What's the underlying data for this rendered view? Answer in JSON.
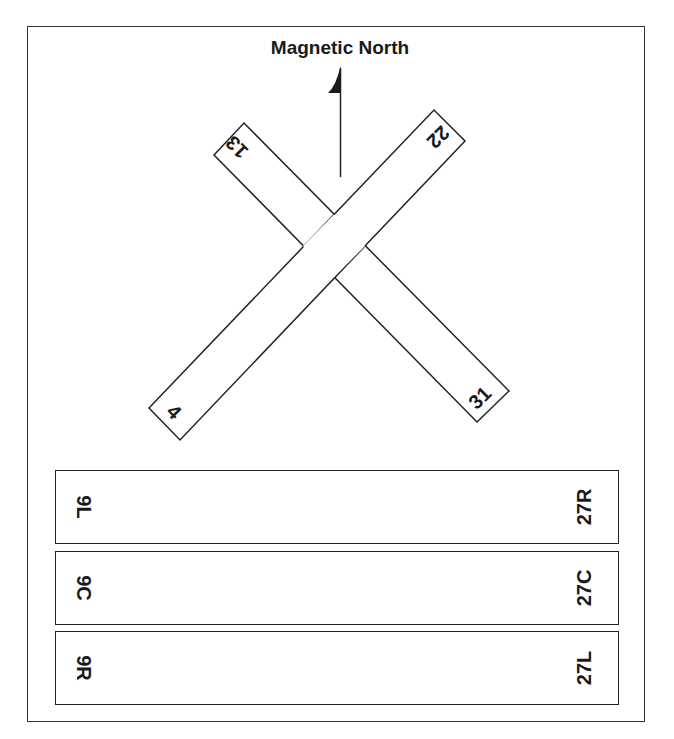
{
  "title": "Magnetic North",
  "colors": {
    "stroke": "#222222",
    "background": "#ffffff",
    "text": "#1a1a1a"
  },
  "north_arrow": {
    "icon": "north-arrow-icon"
  },
  "crossing_runways": {
    "runway_4_22": {
      "end_a": "4",
      "end_b": "22"
    },
    "runway_13_31": {
      "end_a": "13",
      "end_b": "31"
    }
  },
  "parallel_runways": [
    {
      "left_label": "9L",
      "right_label": "27R"
    },
    {
      "left_label": "9C",
      "right_label": "27C"
    },
    {
      "left_label": "9R",
      "right_label": "27L"
    }
  ]
}
